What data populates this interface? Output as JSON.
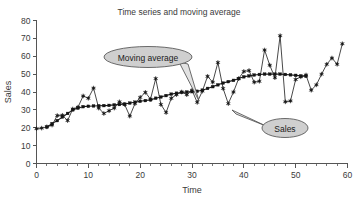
{
  "chart_data": {
    "type": "line",
    "title": "Time series and moving average",
    "xlabel": "Time",
    "ylabel": "Sales",
    "xlim": [
      0,
      60
    ],
    "ylim": [
      0,
      80
    ],
    "x_ticks": [
      0,
      10,
      20,
      30,
      40,
      50,
      60
    ],
    "y_ticks": [
      0,
      10,
      20,
      30,
      40,
      50,
      60,
      70,
      80
    ],
    "x_minor_step": 2,
    "grid": false,
    "legend_position": "annotations",
    "x": [
      0,
      1,
      2,
      3,
      4,
      5,
      6,
      7,
      8,
      9,
      10,
      11,
      12,
      13,
      14,
      15,
      16,
      17,
      18,
      19,
      20,
      21,
      22,
      23,
      24,
      25,
      26,
      27,
      28,
      29,
      30,
      31,
      32,
      33,
      34,
      35,
      36,
      37,
      38,
      39,
      40,
      41,
      42,
      43,
      44,
      45,
      46,
      47,
      48,
      49,
      50,
      51,
      52,
      53,
      54,
      55,
      56,
      57,
      58,
      59
    ],
    "series": [
      {
        "name": "Sales",
        "marker": "star",
        "values": [
          19.5,
          19.8,
          20.5,
          21.5,
          26.8,
          27.0,
          24.0,
          30.5,
          31.5,
          37.8,
          36.5,
          42.2,
          31.0,
          28.0,
          29.5,
          31.0,
          34.5,
          33.0,
          26.5,
          33.5,
          37.0,
          39.8,
          36.0,
          47.5,
          33.0,
          28.5,
          36.5,
          38.5,
          40.0,
          38.5,
          41.0,
          34.2,
          40.5,
          48.8,
          45.5,
          56.5,
          42.0,
          33.5,
          40.0,
          47.5,
          51.5,
          52.0,
          45.5,
          46.0,
          63.5,
          55.0,
          48.0,
          71.5,
          34.5,
          35.0,
          47.0,
          48.5,
          49.5,
          41.0,
          44.0,
          50.0,
          55.5,
          59.0,
          55.5,
          67.0
        ]
      },
      {
        "name": "Moving average",
        "marker": "square",
        "values": [
          null,
          null,
          20.4,
          22.3,
          24.0,
          26.0,
          28.0,
          30.0,
          31.0,
          31.8,
          32.0,
          32.2,
          32.3,
          32.4,
          32.5,
          32.8,
          33.0,
          33.2,
          33.8,
          34.3,
          34.8,
          35.2,
          35.6,
          36.5,
          37.2,
          38.0,
          38.8,
          39.3,
          39.8,
          40.0,
          40.2,
          40.4,
          41.0,
          42.0,
          43.0,
          44.0,
          45.0,
          45.8,
          46.5,
          47.5,
          48.5,
          49.0,
          49.5,
          49.8,
          50.0,
          50.0,
          50.0,
          50.0,
          49.8,
          49.6,
          49.3,
          49.0,
          48.8,
          null,
          null,
          null,
          null,
          null,
          null,
          null
        ]
      }
    ],
    "annotations": [
      {
        "label": "Moving average",
        "points_to_x": 30,
        "points_to_y": 40.5
      },
      {
        "label": "Sales",
        "points_to_x": 37,
        "points_to_y": 33.5
      }
    ]
  }
}
